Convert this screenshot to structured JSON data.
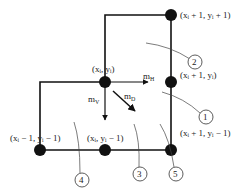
{
  "diagram": {
    "nodes": [
      {
        "id": "top-right",
        "label": "(xᵢ + 1, yᵢ + 1)",
        "x": 171,
        "y": 15
      },
      {
        "id": "center",
        "label": "(xᵢ, yᵢ)",
        "x": 105,
        "y": 82
      },
      {
        "id": "mid-right",
        "label": "(xᵢ + 1, yᵢ)",
        "x": 171,
        "y": 82
      },
      {
        "id": "bottom-left",
        "label": "(xᵢ − 1, yᵢ − 1)",
        "x": 40,
        "y": 150
      },
      {
        "id": "bottom-center",
        "label": "(xᵢ, yᵢ − 1)",
        "x": 105,
        "y": 150
      },
      {
        "id": "bottom-right",
        "label": "(xᵢ + 1, yᵢ − 1)",
        "x": 171,
        "y": 150
      }
    ],
    "arrows": {
      "horizontal": "m_H",
      "vertical": "m_V",
      "diagonal": "m_D"
    },
    "regions": [
      "1",
      "2",
      "3",
      "4",
      "5"
    ]
  }
}
